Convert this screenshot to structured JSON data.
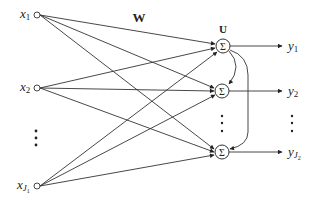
{
  "diagram": {
    "weight_label_in": "W",
    "weight_label_rec": "U",
    "sum_symbol": "Σ",
    "inputs": [
      {
        "name": "x",
        "sub": "1"
      },
      {
        "name": "x",
        "sub": "2"
      },
      {
        "name": "x",
        "sub": "J",
        "subsub": "1"
      }
    ],
    "outputs": [
      {
        "name": "y",
        "sub": "1"
      },
      {
        "name": "y",
        "sub": "2"
      },
      {
        "name": "y",
        "sub": "J",
        "subsub": "2"
      }
    ],
    "ellipsis": "⋮"
  }
}
